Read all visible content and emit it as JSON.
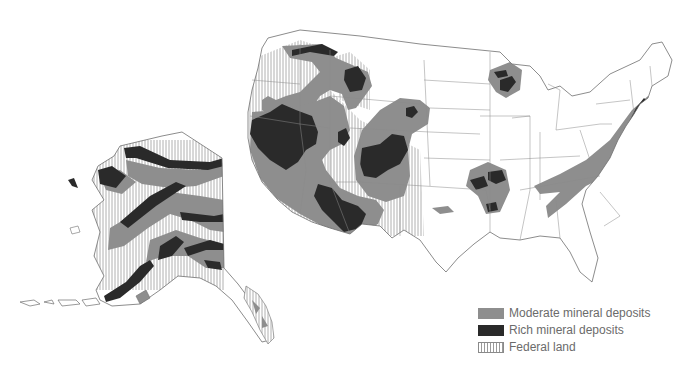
{
  "map": {
    "subject": "United States mineral deposits and federal land",
    "regions": [
      "Contiguous United States",
      "Alaska"
    ],
    "colors": {
      "moderate": "#8e8e8e",
      "rich": "#2a2a2a",
      "federal_hatch": "#9a9a9a",
      "outline": "#6f6f6f",
      "background": "#ffffff"
    }
  },
  "legend": {
    "items": [
      {
        "key": "moderate",
        "label": "Moderate mineral deposits"
      },
      {
        "key": "rich",
        "label": "Rich mineral deposits"
      },
      {
        "key": "federal",
        "label": "Federal land"
      }
    ]
  }
}
